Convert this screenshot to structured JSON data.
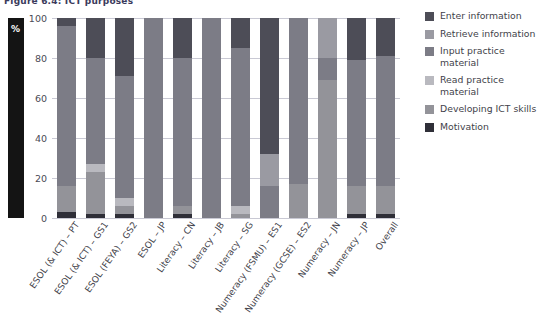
{
  "title": "Figure 6.4: ICT purposes",
  "axis_unit_label": "%",
  "chart_data": {
    "type": "bar",
    "stacked": true,
    "title": "Figure 6.4: ICT purposes",
    "xlabel": "",
    "ylabel": "%",
    "ylim": [
      0,
      100
    ],
    "yticks": [
      0,
      20,
      40,
      60,
      80,
      100
    ],
    "grid": true,
    "legend_position": "right",
    "categories": [
      "ESOL (& ICT) – PT",
      "ESOL (& ICT) – GS1",
      "ESOL (FEYA) – GS2",
      "ESOL – JP",
      "Literacy – CN",
      "Literacy – JB",
      "Literacy – SG",
      "Numeracy (FSMU) – ES1",
      "Numeracy (GCSE) – ES2",
      "Numeracy – JN",
      "Numeracy – JP"
    ],
    "series": [
      {
        "name": "Enter information",
        "color": "#4d4d57",
        "values": [
          4,
          20,
          29,
          0,
          20,
          0,
          15,
          68,
          0,
          0,
          21
        ]
      },
      {
        "name": "Retrieve information",
        "color": "#9a9aa2",
        "values": [
          0,
          0,
          0,
          0,
          0,
          0,
          0,
          16,
          0,
          20,
          0
        ]
      },
      {
        "name": "Input practice material",
        "color": "#7c7c86",
        "values": [
          80,
          53,
          61,
          100,
          74,
          100,
          79,
          16,
          83,
          11,
          63
        ]
      },
      {
        "name": "Read practice material",
        "color": "#b9b9bf",
        "values": [
          0,
          4,
          4,
          0,
          0,
          0,
          4,
          0,
          0,
          0,
          0
        ]
      },
      {
        "name": "Developing ICT skills",
        "color": "#939399",
        "values": [
          13,
          21,
          4,
          0,
          4,
          0,
          2,
          0,
          17,
          69,
          14
        ]
      },
      {
        "name": "Motivation",
        "color": "#2f2f38",
        "values": [
          3,
          2,
          2,
          0,
          2,
          0,
          0,
          0,
          0,
          0,
          2
        ]
      }
    ],
    "overall_bar": {
      "label": "Overall",
      "segments": [
        {
          "name": "Motivation",
          "value": 2,
          "color": "#2f2f38"
        },
        {
          "name": "Developing ICT skills",
          "value": 14,
          "color": "#939399"
        },
        {
          "name": "Input practice material",
          "value": 65,
          "color": "#7c7c86"
        },
        {
          "name": "Enter information",
          "value": 19,
          "color": "#4d4d57"
        }
      ]
    }
  },
  "legend": {
    "items": [
      {
        "label": "Enter information",
        "color": "#4d4d57"
      },
      {
        "label": "Retrieve information",
        "color": "#9a9aa2"
      },
      {
        "label": "Input practice material",
        "color": "#7c7c86"
      },
      {
        "label": "Read practice material",
        "color": "#b9b9bf"
      },
      {
        "label": "Developing ICT skills",
        "color": "#939399"
      },
      {
        "label": "Motivation",
        "color": "#2f2f38"
      }
    ]
  }
}
